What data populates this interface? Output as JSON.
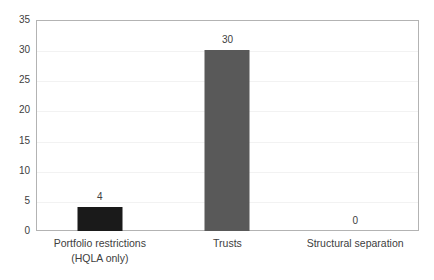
{
  "chart_data": {
    "type": "bar",
    "title": "",
    "subtitle": "",
    "xlabel": "",
    "ylabel": "",
    "categories": [
      "Portfolio restrictions",
      "Trusts",
      "Structural separation"
    ],
    "category_sublabels": [
      "(HQLA only)",
      "",
      ""
    ],
    "values": [
      4,
      30,
      0
    ],
    "value_labels": [
      "4",
      "30",
      "0"
    ],
    "ylim": [
      0,
      35
    ],
    "ytick_labels": [
      "35",
      "30",
      "25",
      "20",
      "15",
      "10",
      "5",
      "0"
    ],
    "ytick_values": [
      35,
      30,
      25,
      20,
      15,
      10,
      5,
      0
    ],
    "grid": true,
    "legend": "none",
    "bar_colors": [
      "#1a1a1a",
      "#595959",
      "#595959"
    ],
    "plot_border_color": "#b3b3b3",
    "gridline_color": "#f2f2f2",
    "text_color": "#404040",
    "background_color": "#ffffff"
  }
}
